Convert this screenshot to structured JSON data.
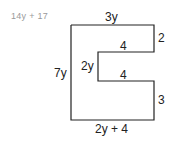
{
  "answer": "14y + 17",
  "shape": {
    "labels": {
      "top": "3y",
      "right_top": "2",
      "notch_top": "4",
      "notch_depth": "2y",
      "notch_bottom": "4",
      "left": "7y",
      "right_bottom": "3",
      "bottom": "2y + 4"
    },
    "stroke_color": "#222222"
  }
}
